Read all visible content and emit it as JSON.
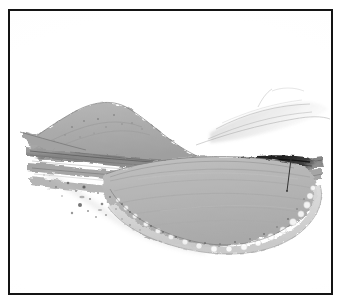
{
  "figure": {
    "domain_type": "photomicrograph",
    "caption": "",
    "frame": {
      "border_color": "#141414",
      "border_width_px": 2,
      "background_color": "#ffffff",
      "x": 8,
      "y": 9,
      "width": 325,
      "height": 286
    },
    "page_background": "#ffffff"
  },
  "image_content": {
    "description": "Low-magnification histological cross-section of tissue on a pale background, oriented horizontally across the frame.",
    "palette": {
      "background": "#ffffff",
      "pale_tissue": "#e6e6e6",
      "light_gray": "#cfcfcf",
      "mid_gray": "#b6b6b6",
      "body_gray": "#b2b2b2",
      "dome_gray": "#a9a9a9",
      "band_gray": "#8f8f8f",
      "dark_band": "#3c3c3c",
      "near_black": "#1e1e1e",
      "debris": "#555555",
      "pointer_line": "#2a2a2a"
    },
    "structures": [
      {
        "id": "dome",
        "name": "dome-shaped-elevation",
        "position": "upper-left",
        "fill": "#a9a9a9",
        "note": "Broad rounded mound rising above the fibrous band layer."
      },
      {
        "id": "fibrous-bands",
        "name": "horizontal-fibrous-band-layer",
        "position": "mid-left to mid-right",
        "fill": "#8f8f8f",
        "note": "Several stacked elongated striated bands running left to right."
      },
      {
        "id": "main-mass",
        "name": "large-oval-mass",
        "position": "center-right lower",
        "fill": "#b2b2b2",
        "note": "Large pale-gray lenticular body occupying the lower central field, bounded by a scalloped vesicular rim."
      },
      {
        "id": "scalloped-rim",
        "name": "scalloped-vesicular-border",
        "position": "lower and right margin of the main mass",
        "fill": "#d8d8d8",
        "note": "Bubbly, vacuolated edge texture outlining the inferior and right margin."
      },
      {
        "id": "dark-band",
        "name": "dark-elongated-band",
        "position": "upper-right",
        "fill": "#1e1e1e",
        "note": "Intensely stained narrow elongated band above the right portion of the mass."
      },
      {
        "id": "wispy-tissue",
        "name": "faint-wispy-tissue",
        "position": "upper-right",
        "fill": "#cfcfcf",
        "note": "Thin translucent strands extending to the upper-right corner."
      },
      {
        "id": "debris-field",
        "name": "scattered-debris-specks",
        "position": "lower-left",
        "fill": "#555555",
        "note": "Scattered small dark granules below and left of the mass."
      }
    ],
    "annotations": [
      {
        "id": "pointer",
        "name": "pointer-line",
        "type": "line",
        "color": "#2a2a2a",
        "from": {
          "x": 281,
          "y": 148
        },
        "to": {
          "x": 277,
          "y": 180
        },
        "label": ""
      }
    ],
    "labels": [],
    "scale_bar": null
  }
}
